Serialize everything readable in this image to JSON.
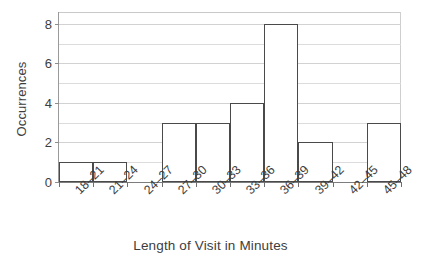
{
  "chart_data": {
    "type": "bar",
    "title": "",
    "subtitle": "",
    "xlabel": "Length of Visit in Minutes",
    "ylabel": "Occurrences",
    "categories": [
      "18–21",
      "21–24",
      "24–27",
      "27–30",
      "30–33",
      "33–36",
      "36–39",
      "39–42",
      "42–45",
      "45–48"
    ],
    "values": [
      1,
      1,
      0,
      3,
      3,
      4,
      8,
      2,
      0,
      3
    ],
    "ylim": [
      0,
      8.6
    ],
    "xlim": [
      0,
      10
    ],
    "ytick_labels": [
      "0",
      "2",
      "4",
      "6",
      "8"
    ],
    "ytick_values": [
      0,
      2,
      4,
      6,
      8
    ],
    "gridline_values": [
      1,
      2,
      3,
      4,
      5,
      6,
      7,
      8
    ],
    "grid": "horizontal",
    "legend": "none",
    "bar_fill_color": "#ffffff",
    "bar_edge_color": "#4a4a4a",
    "gridline_color": "#dcdcdc",
    "axis_color": "#7d7d7d",
    "text_color": "#3d3d3d",
    "background_color": "#ffffff",
    "xtick_label_rotation": "-45",
    "bar_gap": "0"
  }
}
